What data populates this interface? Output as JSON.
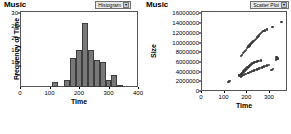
{
  "panels": [
    {
      "title": "Music",
      "selector": {
        "label": "Histogram",
        "arrow": "▾"
      }
    },
    {
      "title": "Music",
      "selector": {
        "label": "Scatter Plot",
        "arrow": "▾"
      }
    }
  ],
  "chart_data": [
    {
      "type": "bar",
      "title": "Music",
      "xlabel": "Time",
      "ylabel": "Frequency of Time",
      "xlim": [
        0,
        400
      ],
      "ylim": [
        0,
        31
      ],
      "xticks": [
        0,
        100,
        200,
        300,
        400
      ],
      "yticks": [
        5,
        10,
        15,
        20,
        25,
        30
      ],
      "grid": false,
      "bin_width": 20,
      "categories": [
        120,
        140,
        160,
        180,
        200,
        220,
        240,
        260,
        280,
        300,
        320,
        340
      ],
      "values": [
        2,
        0,
        3,
        12,
        15,
        26,
        15,
        11,
        10,
        3,
        5,
        1
      ],
      "bar_color": "#787878"
    },
    {
      "type": "scatter",
      "title": "Music",
      "xlabel": "Time",
      "ylabel": "Size",
      "xlim": [
        0,
        380
      ],
      "ylim": [
        0,
        16500000
      ],
      "xticks": [
        0,
        100,
        200,
        300
      ],
      "yticks": [
        0,
        2000000,
        4000000,
        6000000,
        8000000,
        10000000,
        12000000,
        14000000,
        16000000
      ],
      "ytick_labels": [
        "0",
        "2000000",
        "4000000",
        "6000000",
        "8000000",
        "10000000",
        "12000000",
        "14000000",
        "16000000"
      ],
      "grid": false,
      "point_color": "#3a3a3a",
      "points": [
        [
          118,
          1900000
        ],
        [
          124,
          1950000
        ],
        [
          127,
          2000000
        ],
        [
          168,
          3200000
        ],
        [
          170,
          3350000
        ],
        [
          172,
          3100000
        ],
        [
          175,
          3500000
        ],
        [
          178,
          3400000
        ],
        [
          180,
          3700000
        ],
        [
          182,
          3600000
        ],
        [
          184,
          3900000
        ],
        [
          186,
          3800000
        ],
        [
          188,
          4100000
        ],
        [
          190,
          4000000
        ],
        [
          192,
          4300000
        ],
        [
          194,
          4200000
        ],
        [
          196,
          4500000
        ],
        [
          198,
          4400000
        ],
        [
          200,
          4700000
        ],
        [
          202,
          4600000
        ],
        [
          204,
          4900000
        ],
        [
          206,
          4800000
        ],
        [
          208,
          5000000
        ],
        [
          210,
          4950000
        ],
        [
          212,
          5200000
        ],
        [
          214,
          5100000
        ],
        [
          216,
          5400000
        ],
        [
          218,
          5300000
        ],
        [
          220,
          5500000
        ],
        [
          222,
          5450000
        ],
        [
          224,
          5700000
        ],
        [
          226,
          5600000
        ],
        [
          228,
          5800000
        ],
        [
          230,
          5750000
        ],
        [
          234,
          5900000
        ],
        [
          238,
          6000000
        ],
        [
          242,
          6050000
        ],
        [
          246,
          6100000
        ],
        [
          252,
          6200000
        ],
        [
          258,
          6150000
        ],
        [
          264,
          6300000
        ],
        [
          176,
          3000000
        ],
        [
          180,
          3100000
        ],
        [
          186,
          3250000
        ],
        [
          190,
          3300000
        ],
        [
          196,
          3450000
        ],
        [
          200,
          3500000
        ],
        [
          206,
          3650000
        ],
        [
          210,
          3700000
        ],
        [
          216,
          3850000
        ],
        [
          220,
          3900000
        ],
        [
          226,
          4050000
        ],
        [
          230,
          4100000
        ],
        [
          236,
          4250000
        ],
        [
          240,
          4300000
        ],
        [
          246,
          4450000
        ],
        [
          250,
          4500000
        ],
        [
          256,
          4650000
        ],
        [
          262,
          4750000
        ],
        [
          268,
          4850000
        ],
        [
          274,
          4950000
        ],
        [
          280,
          5050000
        ],
        [
          286,
          5150000
        ],
        [
          292,
          5250000
        ],
        [
          300,
          5400000
        ],
        [
          308,
          4300000
        ],
        [
          312,
          4400000
        ],
        [
          318,
          4600000
        ],
        [
          176,
          7300000
        ],
        [
          180,
          7500000
        ],
        [
          186,
          7900000
        ],
        [
          190,
          8100000
        ],
        [
          194,
          8300000
        ],
        [
          198,
          8500000
        ],
        [
          202,
          8800000
        ],
        [
          206,
          9000000
        ],
        [
          210,
          9200000
        ],
        [
          214,
          9400000
        ],
        [
          218,
          9600000
        ],
        [
          222,
          9800000
        ],
        [
          226,
          10000000
        ],
        [
          230,
          10200000
        ],
        [
          234,
          10400000
        ],
        [
          238,
          10600000
        ],
        [
          242,
          10800000
        ],
        [
          246,
          11000000
        ],
        [
          250,
          11200000
        ],
        [
          254,
          11400000
        ],
        [
          258,
          11600000
        ],
        [
          262,
          11800000
        ],
        [
          266,
          12000000
        ],
        [
          270,
          12100000
        ],
        [
          276,
          12300000
        ],
        [
          282,
          12500000
        ],
        [
          290,
          12700000
        ],
        [
          316,
          13200000
        ],
        [
          330,
          6500000
        ],
        [
          334,
          7000000
        ],
        [
          338,
          6700000
        ],
        [
          356,
          14200000
        ]
      ]
    }
  ]
}
